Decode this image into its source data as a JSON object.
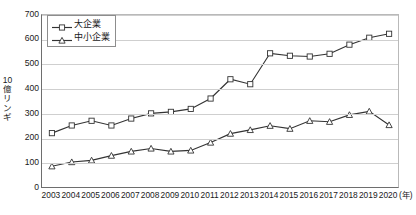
{
  "chart_data": {
    "type": "line",
    "title": "",
    "subtitle": "",
    "xlabel": "(年)",
    "ylabel": "10\n億\nリ\nン\nギ",
    "ylabel_text": "10億リンギ",
    "x_unit_suffix": "(年)",
    "categories": [
      "2003",
      "2004",
      "2005",
      "2006",
      "2007",
      "2008",
      "2009",
      "2010",
      "2011",
      "2012",
      "2013",
      "2014",
      "2015",
      "2016",
      "2017",
      "2018",
      "2019",
      "2020"
    ],
    "ylim": [
      0,
      700
    ],
    "yticks": [
      0,
      100,
      200,
      300,
      400,
      500,
      600,
      700
    ],
    "grid": true,
    "legend_position": "top-left",
    "series": [
      {
        "name": "大企業",
        "marker": "open-square",
        "color": "#333333",
        "values": [
          222,
          253,
          272,
          253,
          281,
          302,
          308,
          320,
          362,
          440,
          420,
          545,
          535,
          532,
          543,
          580,
          608,
          624
        ]
      },
      {
        "name": "中小企業",
        "marker": "open-triangle",
        "color": "#333333",
        "values": [
          88,
          105,
          112,
          131,
          148,
          160,
          148,
          152,
          184,
          220,
          235,
          252,
          240,
          272,
          268,
          296,
          310,
          255
        ]
      }
    ]
  },
  "axes": {
    "y_unit_label": "10億リンギ",
    "x_unit_label": "(年)"
  },
  "colors": {
    "line": "#333333",
    "grid": "#cfcfcf",
    "axis": "#6e6e6e",
    "text": "#1a1a1a",
    "marker_fill": "#ffffff"
  }
}
